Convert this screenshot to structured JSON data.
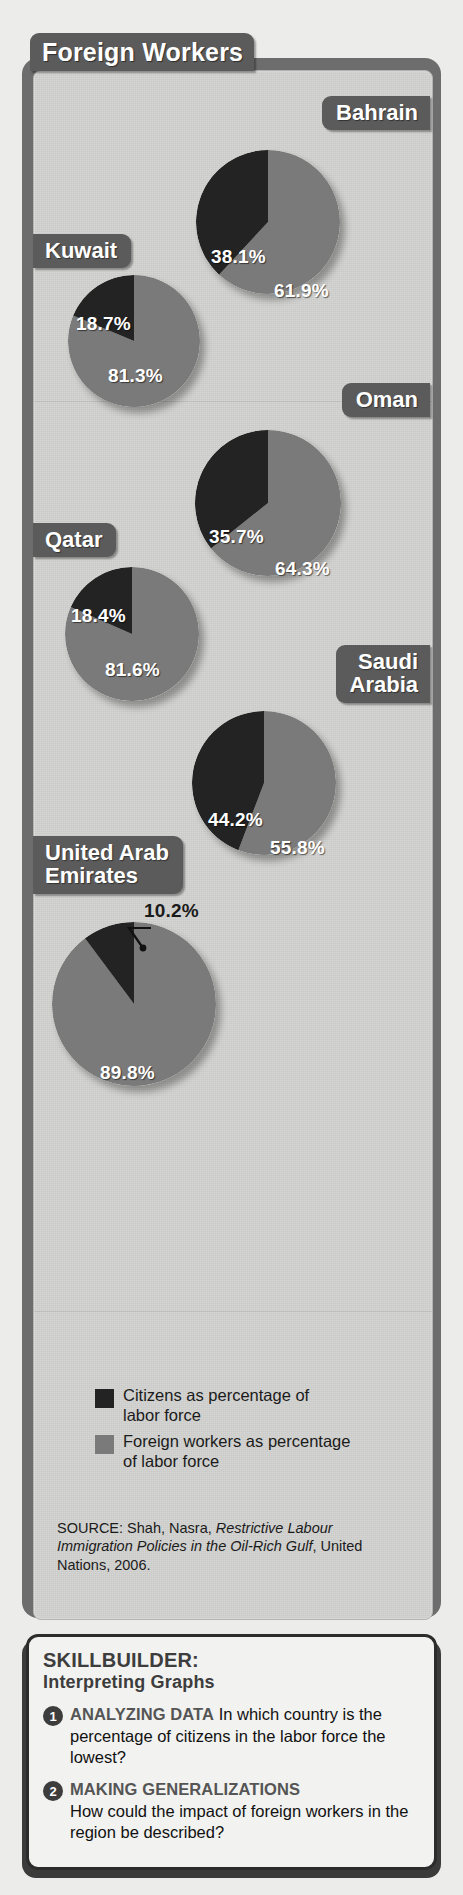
{
  "title": "Foreign Workers",
  "legend": [
    {
      "color": "#232323",
      "label": "Citizens as percentage of\nlabor force",
      "name": "citizens"
    },
    {
      "color": "#7a7a7a",
      "label": "Foreign workers as percentage\nof labor force",
      "name": "foreign-workers"
    }
  ],
  "source": {
    "prefix": "SOURCE: Shah, Nasra, ",
    "italic": "Restrictive Labour Immigration Policies in the Oil-Rich Gulf",
    "suffix": ", United Nations, 2006."
  },
  "skillbuilder": {
    "title_line1": "SKILLBUILDER:",
    "title_line2": "Interpreting Graphs",
    "items": [
      {
        "number": "1",
        "category": "ANALYZING DATA",
        "question": "In which country is the percentage of citizens in the labor force the lowest?"
      },
      {
        "number": "2",
        "category": "MAKING GENERALIZATIONS",
        "question": "How could the impact of foreign workers in the region be described?"
      }
    ]
  },
  "chart_data": {
    "type": "pie",
    "title": "Foreign Workers",
    "series_labels": [
      "Citizens as percentage of labor force",
      "Foreign workers as percentage of labor force"
    ],
    "colors": {
      "citizens": "#232323",
      "foreign": "#7a7a7a"
    },
    "source": "SOURCE: Shah, Nasra, Restrictive Labour Immigration Policies in the Oil-Rich Gulf, United Nations, 2006.",
    "charts": [
      {
        "country": "Bahrain",
        "citizens": 38.1,
        "foreign": 61.9,
        "citizens_label": "38.1%",
        "foreign_label": "61.9%"
      },
      {
        "country": "Kuwait",
        "citizens": 18.7,
        "foreign": 81.3,
        "citizens_label": "18.7%",
        "foreign_label": "81.3%"
      },
      {
        "country": "Oman",
        "citizens": 35.7,
        "foreign": 64.3,
        "citizens_label": "35.7%",
        "foreign_label": "64.3%"
      },
      {
        "country": "Qatar",
        "citizens": 18.4,
        "foreign": 81.6,
        "citizens_label": "18.4%",
        "foreign_label": "81.6%"
      },
      {
        "country": "Saudi Arabia",
        "citizens": 44.2,
        "foreign": 55.8,
        "citizens_label": "44.2%",
        "foreign_label": "55.8%"
      },
      {
        "country": "United Arab Emirates",
        "citizens": 10.2,
        "foreign": 89.8,
        "citizens_label": "10.2%",
        "foreign_label": "89.8%"
      }
    ]
  },
  "pies": [
    {
      "id": "bahrain",
      "label": "Bahrain",
      "label_side": "right",
      "pill_top": 96,
      "pill_font": 22,
      "cx": 268,
      "cy": 222,
      "r": 72,
      "citizens": 38.1,
      "foreign": 61.9,
      "c_label": "38.1%",
      "f_label": "61.9%",
      "c_pos": {
        "left": 15,
        "top": 96
      },
      "f_pos": {
        "left": 78,
        "top": 130
      }
    },
    {
      "id": "kuwait",
      "label": "Kuwait",
      "label_side": "left",
      "pill_top": 234,
      "pill_font": 22,
      "cx": 134,
      "cy": 341,
      "r": 66,
      "citizens": 18.7,
      "foreign": 81.3,
      "c_label": "18.7%",
      "f_label": "81.3%",
      "c_pos": {
        "left": 8,
        "top": 38
      },
      "f_pos": {
        "left": 40,
        "top": 90
      }
    },
    {
      "id": "oman",
      "label": "Oman",
      "label_side": "right",
      "pill_top": 383,
      "pill_font": 22,
      "cx": 268,
      "cy": 503,
      "r": 73,
      "citizens": 35.7,
      "foreign": 64.3,
      "c_label": "35.7%",
      "f_label": "64.3%",
      "c_pos": {
        "left": 14,
        "top": 96
      },
      "f_pos": {
        "left": 80,
        "top": 128
      }
    },
    {
      "id": "qatar",
      "label": "Qatar",
      "label_side": "left",
      "pill_top": 523,
      "pill_font": 22,
      "cx": 132,
      "cy": 634,
      "r": 67,
      "citizens": 18.4,
      "foreign": 81.6,
      "c_label": "18.4%",
      "f_label": "81.6%",
      "c_pos": {
        "left": 6,
        "top": 38
      },
      "f_pos": {
        "left": 40,
        "top": 92
      }
    },
    {
      "id": "saudi",
      "label": "Saudi\nArabia",
      "label_side": "right",
      "pill_top": 645,
      "pill_font": 22,
      "cx": 264,
      "cy": 783,
      "r": 72,
      "citizens": 44.2,
      "foreign": 55.8,
      "c_label": "44.2%",
      "f_label": "55.8%",
      "c_pos": {
        "left": 16,
        "top": 98
      },
      "f_pos": {
        "left": 78,
        "top": 126
      }
    },
    {
      "id": "uae",
      "label": "United Arab\nEmirates",
      "label_side": "left",
      "pill_top": 836,
      "pill_font": 22,
      "cx": 134,
      "cy": 1004,
      "r": 82,
      "citizens": 10.2,
      "foreign": 89.8,
      "c_label": "10.2%",
      "f_label": "89.8%",
      "c_pos": {
        "left": 92,
        "top": -22
      },
      "f_pos": {
        "left": 48,
        "top": 140
      }
    }
  ]
}
